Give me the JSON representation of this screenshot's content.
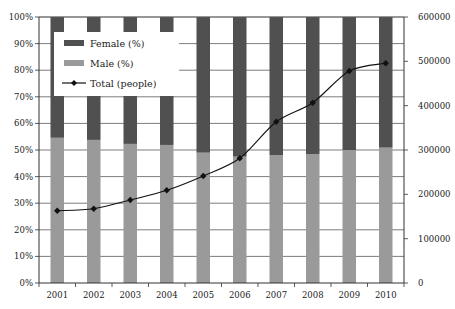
{
  "chart_data": {
    "type": "bar",
    "subtype": "stacked-percent-bar-with-line-secondary-axis",
    "title": "",
    "xlabel": "",
    "ylabel": "",
    "y2label": "",
    "categories": [
      "2001",
      "2002",
      "2003",
      "2004",
      "2005",
      "2006",
      "2007",
      "2008",
      "2009",
      "2010"
    ],
    "series": [
      {
        "name": "Male (%)",
        "kind": "bar",
        "axis": "left",
        "color": "#9a9a9a",
        "values": [
          54.6,
          53.8,
          52.3,
          51.9,
          49.0,
          47.5,
          48.1,
          48.5,
          50.0,
          50.9
        ]
      },
      {
        "name": "Female (%)",
        "kind": "bar",
        "axis": "left",
        "color": "#505050",
        "values": [
          45.4,
          46.2,
          47.7,
          48.1,
          51.0,
          52.5,
          51.9,
          51.5,
          50.0,
          49.1
        ]
      },
      {
        "name": "Total (people)",
        "kind": "line",
        "axis": "right",
        "color": "#111111",
        "marker": "diamond",
        "values": [
          163000,
          167600,
          187200,
          209100,
          241400,
          281300,
          363800,
          406700,
          478200,
          495600
        ]
      }
    ],
    "ylim": [
      0,
      100
    ],
    "y_ticks": [
      "0%",
      "10%",
      "20%",
      "30%",
      "40%",
      "50%",
      "60%",
      "70%",
      "80%",
      "90%",
      "100%"
    ],
    "y2lim": [
      0,
      600000
    ],
    "y2_ticks": [
      "0",
      "100000",
      "200000",
      "300000",
      "400000",
      "500000",
      "600000"
    ],
    "grid": true,
    "legend": {
      "placement": "top-left-inside",
      "entries": [
        {
          "label": "Female (%)",
          "swatch": "bar",
          "color": "#505050"
        },
        {
          "label": "Male (%)",
          "swatch": "bar",
          "color": "#9a9a9a"
        },
        {
          "label": "Total (people)",
          "swatch": "line-marker",
          "color": "#111111"
        }
      ]
    }
  }
}
